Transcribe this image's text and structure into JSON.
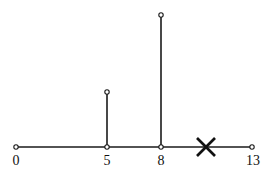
{
  "diagram": {
    "axis": {
      "y": 147,
      "x_start": 16,
      "x_end": 252,
      "color": "#1a1a1a"
    },
    "ticks": [
      {
        "label": "0",
        "value": 0,
        "x": 16
      },
      {
        "label": "5",
        "value": 5,
        "x": 107
      },
      {
        "label": "8",
        "value": 8,
        "x": 161
      },
      {
        "label": "13",
        "value": 13,
        "x": 252
      }
    ],
    "stems": [
      {
        "at": "5",
        "x": 107,
        "top_y": 92
      },
      {
        "at": "8",
        "x": 161,
        "top_y": 15
      }
    ],
    "cross_mark": {
      "x": 206,
      "y": 147,
      "size": 8
    }
  }
}
